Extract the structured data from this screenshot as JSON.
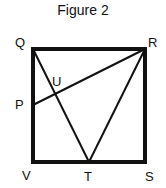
{
  "figure": {
    "title": "Figure 2",
    "points": {
      "Q": {
        "label": "Q",
        "x": 33,
        "y": 49
      },
      "R": {
        "label": "R",
        "x": 145,
        "y": 49
      },
      "S": {
        "label": "S",
        "x": 145,
        "y": 162
      },
      "V": {
        "label": "V",
        "x": 33,
        "y": 162
      },
      "P": {
        "label": "P",
        "x": 33,
        "y": 105
      },
      "T": {
        "label": "T",
        "x": 89,
        "y": 162
      },
      "U": {
        "label": "U",
        "x": 54,
        "y": 93
      }
    },
    "segments": [
      "QR",
      "RS",
      "SV",
      "VQ",
      "QT",
      "RT",
      "PR"
    ],
    "colors": {
      "stroke": "#111111",
      "background": "#ffffff"
    }
  }
}
